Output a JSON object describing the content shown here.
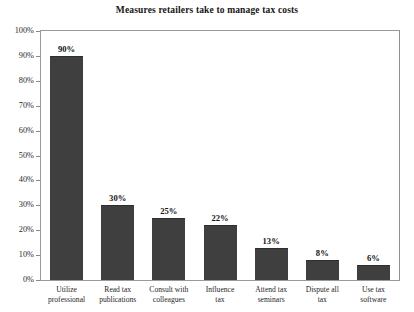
{
  "chart_data": {
    "type": "bar",
    "title": "Measures retailers take to manage tax costs",
    "xlabel": "",
    "ylabel": "",
    "ylim": [
      0,
      100
    ],
    "grid": false,
    "legend": "none",
    "value_suffix": "%",
    "ytick_labels": [
      "100%",
      "90%",
      "80%",
      "70%",
      "60%",
      "50%",
      "40%",
      "30%",
      "20%",
      "10%",
      "0%"
    ],
    "ytick_values": [
      100,
      90,
      80,
      70,
      60,
      50,
      40,
      30,
      20,
      10,
      0
    ],
    "categories": [
      "Utilize professional",
      "Read tax publications",
      "Consult with colleagues",
      "Influence tax",
      "Attend tax seminars",
      "Dispute all tax",
      "Use tax software"
    ],
    "category_lines": [
      [
        "Utilize",
        "professional"
      ],
      [
        "Read tax",
        "publications"
      ],
      [
        "Consult with",
        "colleagues"
      ],
      [
        "Influence",
        "tax"
      ],
      [
        "Attend tax",
        "seminars"
      ],
      [
        "Dispute all",
        "tax"
      ],
      [
        "Use tax",
        "software"
      ]
    ],
    "values": [
      90,
      30,
      25,
      22,
      13,
      8,
      6
    ],
    "value_labels": [
      "90%",
      "30%",
      "25%",
      "22%",
      "13%",
      "8%",
      "6%"
    ],
    "bar_color": "#3f3f3f",
    "axis_color": "#9a9a9a",
    "text_color": "#1c1c1c",
    "background": "#ffffff"
  }
}
